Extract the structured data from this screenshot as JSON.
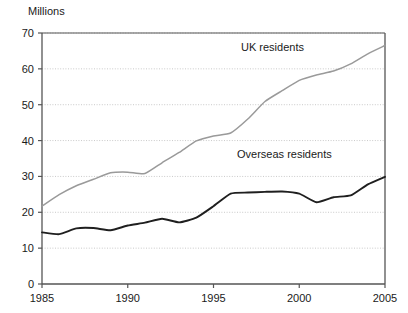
{
  "chart_data": {
    "type": "line",
    "title": "",
    "ylabel": "Millions",
    "xlabel": "",
    "xlim": [
      1985,
      2005
    ],
    "ylim": [
      0,
      70
    ],
    "grid": true,
    "grid_axis": "y",
    "legend_position": "inline-annotation",
    "x": [
      1985,
      1986,
      1987,
      1988,
      1989,
      1990,
      1991,
      1992,
      1993,
      1994,
      1995,
      1996,
      1997,
      1998,
      1999,
      2000,
      2001,
      2002,
      2003,
      2004,
      2005
    ],
    "yticks": [
      0,
      10,
      20,
      30,
      40,
      50,
      60,
      70
    ],
    "ytick_labels": [
      "0",
      "10",
      "20",
      "30",
      "40",
      "50",
      "60",
      "70"
    ],
    "xticks": [
      1985,
      1990,
      1995,
      2000,
      2005
    ],
    "xtick_labels": [
      "1985",
      "1990",
      "1995",
      "2000",
      "2005"
    ],
    "series": [
      {
        "name": "UK residents",
        "color": "#9a9a9a",
        "label_x": 1999,
        "label_y": 64,
        "values": [
          21.7,
          24.9,
          27.4,
          29.2,
          31.0,
          31.2,
          30.8,
          33.8,
          36.7,
          39.9,
          41.3,
          42.1,
          46.0,
          50.9,
          53.9,
          56.8,
          58.3,
          59.4,
          61.4,
          64.2,
          66.5
        ]
      },
      {
        "name": "Overseas residents",
        "color": "#1f1f1f",
        "label_x": 1996,
        "label_y": 36,
        "values": [
          14.4,
          13.9,
          15.5,
          15.6,
          15.0,
          16.3,
          17.1,
          18.2,
          17.2,
          18.5,
          21.7,
          25.2,
          25.5,
          25.7,
          25.8,
          25.2,
          22.8,
          24.2,
          24.7,
          27.8,
          29.9
        ]
      }
    ]
  },
  "axis_title": "Millions",
  "labels": {
    "uk_residents": "UK residents",
    "overseas_residents": "Overseas residents"
  },
  "colors": {
    "uk_residents_line": "#9a9a9a",
    "overseas_residents_line": "#1f1f1f",
    "axis": "#555555",
    "gridline": "#c9c9c9",
    "background": "#ffffff"
  }
}
